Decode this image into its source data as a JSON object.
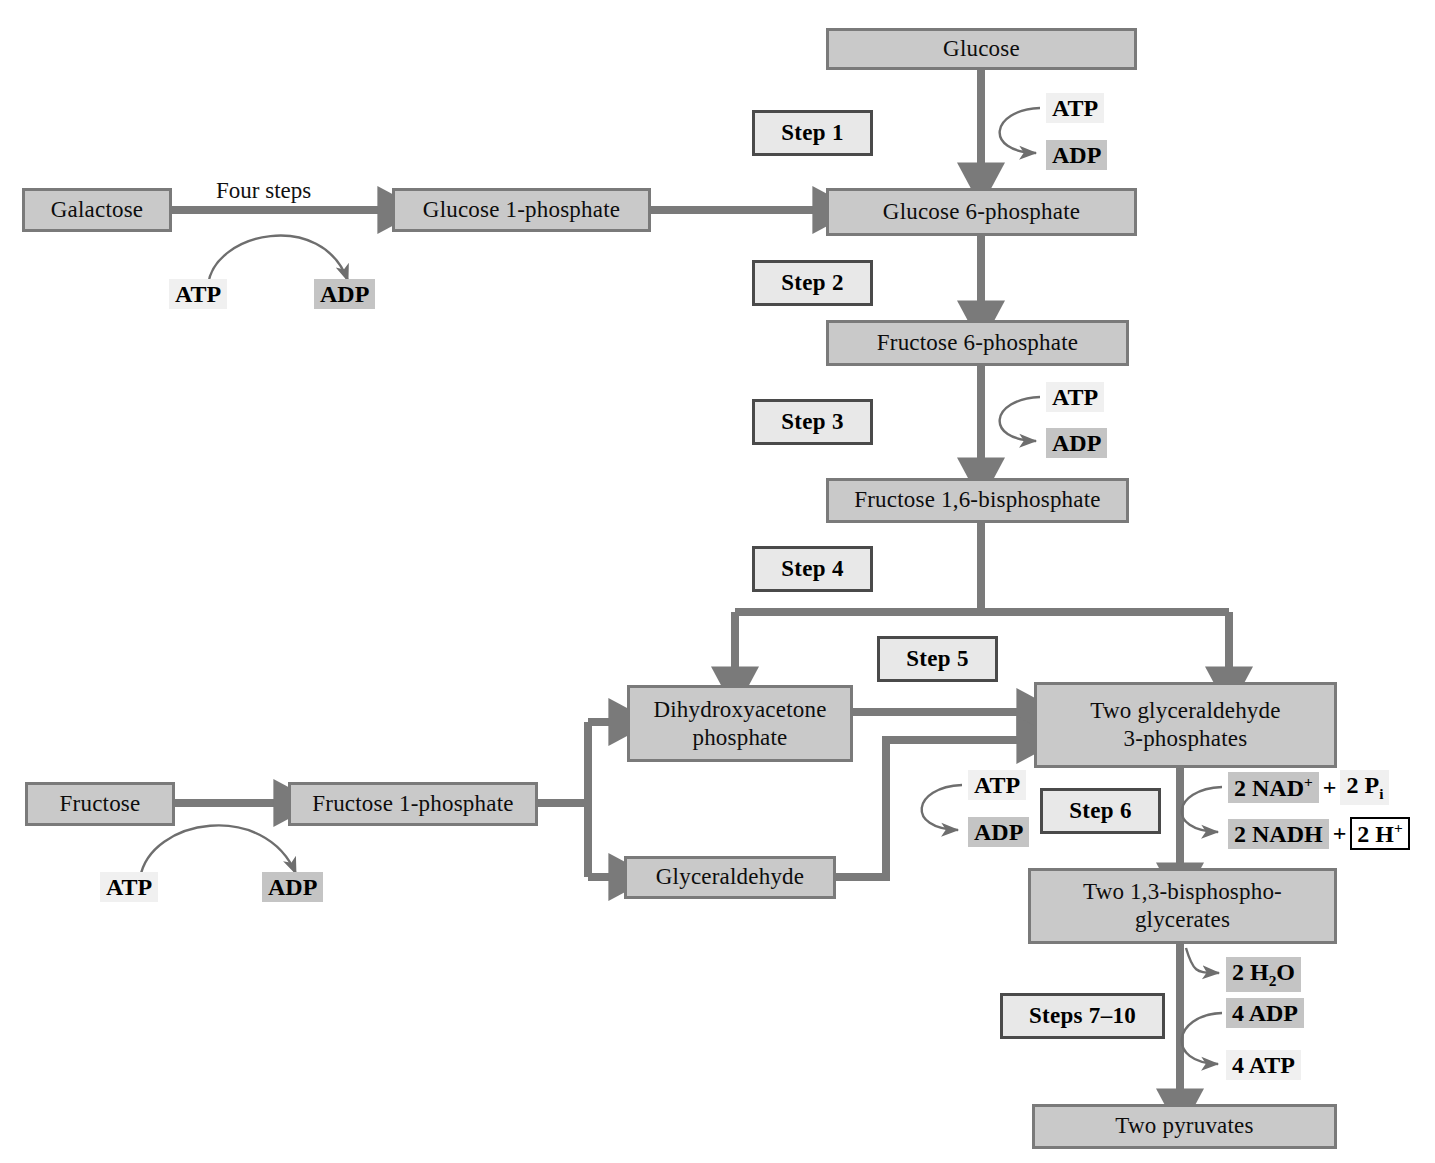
{
  "diagram": {
    "colors": {
      "metabolite_fill": "#c9c9c9",
      "metabolite_border": "#7a7a7a",
      "step_fill": "#e8e8e8",
      "step_border": "#4a4a4a",
      "arrow": "#7a7a7a",
      "cofactor_light": "#f0f0f0",
      "cofactor_dark": "#c4c4c4",
      "background": "#ffffff"
    }
  },
  "metabolites": {
    "glucose": "Glucose",
    "galactose": "Galactose",
    "glucose_1_phosphate": "Glucose 1-phosphate",
    "glucose_6_phosphate": "Glucose 6-phosphate",
    "fructose_6_phosphate": "Fructose 6-phosphate",
    "fructose_16_bisphosphate": "Fructose 1,6-bisphosphate",
    "dhap_line1": "Dihydroxyacetone",
    "dhap_line2": "phosphate",
    "g3p_line1": "Two glyceraldehyde",
    "g3p_line2": "3-phosphates",
    "fructose": "Fructose",
    "fructose_1_phosphate": "Fructose 1-phosphate",
    "glyceraldehyde": "Glyceraldehyde",
    "bpg_line1": "Two 1,3-bisphospho-",
    "bpg_line2": "glycerates",
    "pyruvate": "Two pyruvates"
  },
  "steps": {
    "step1": "Step 1",
    "step2": "Step 2",
    "step3": "Step 3",
    "step4": "Step 4",
    "step5": "Step 5",
    "step6": "Step 6",
    "step7_10": "Steps 7–10"
  },
  "labels": {
    "four_steps": "Four steps"
  },
  "cofactors": {
    "galactose_atp": "ATP",
    "galactose_adp": "ADP",
    "step1_atp": "ATP",
    "step1_adp": "ADP",
    "step3_atp": "ATP",
    "step3_adp": "ADP",
    "fructose_atp": "ATP",
    "fructose_adp": "ADP",
    "glyceraldehyde_atp": "ATP",
    "glyceraldehyde_adp": "ADP",
    "nad_count": "2 NAD",
    "nad_charge": "+",
    "pi_plus": "+",
    "pi_count": "2 P",
    "pi_sub": "i",
    "nadh": "2 NADH",
    "nadh_plus": "+",
    "h_count": "2 H",
    "h_charge": "+",
    "water_count": "2 H",
    "water_sub": "2",
    "water_o": "O",
    "adp4": "4 ADP",
    "atp4": "4 ATP"
  }
}
